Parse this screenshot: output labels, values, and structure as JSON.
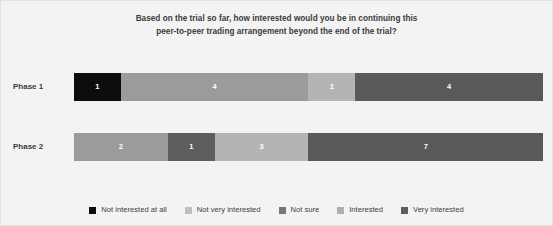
{
  "chart_data": {
    "type": "bar",
    "orientation": "horizontal",
    "stacked": true,
    "normalized": true,
    "title": "Based on the trial so far, how interested would you be in continuing this peer-to-peer trading arrangement beyond the end of the trial?",
    "title_lines": [
      "Based on the trial so far, how interested would you be in continuing this",
      "peer-to-peer trading arrangement beyond the end of the trial?"
    ],
    "xlabel": "",
    "ylabel": "",
    "grid": false,
    "legend_position": "bottom",
    "categories": [
      "Phase 1",
      "Phase 2"
    ],
    "series": [
      {
        "name": "Not interested at all",
        "color": "#0d0d0d",
        "values": [
          1,
          0
        ]
      },
      {
        "name": "Not very interested",
        "color": "#9b9b9b",
        "values": [
          4,
          2
        ]
      },
      {
        "name": "Not sure",
        "color": "#5e5e5e",
        "values": [
          0,
          1
        ]
      },
      {
        "name": "Interested",
        "color": "#b4b4b4",
        "values": [
          1,
          3
        ]
      },
      {
        "name": "Very interested",
        "color": "#595959",
        "values": [
          4,
          7
        ]
      }
    ],
    "bars": [
      {
        "category": "Phase 1",
        "total": 10,
        "segments": [
          {
            "label": "Not interested at all",
            "value": 1,
            "color": "#0d0d0d",
            "percent": 10,
            "show_value": true
          },
          {
            "label": "Not very interested",
            "value": 4,
            "color": "#9b9b9b",
            "percent": 40,
            "show_value": true
          },
          {
            "label": "Not sure",
            "value": 0,
            "color": "#5e5e5e",
            "percent": 0,
            "show_value": false
          },
          {
            "label": "Interested",
            "value": 1,
            "color": "#b4b4b4",
            "percent": 10,
            "show_value": true
          },
          {
            "label": "Very interested",
            "value": 4,
            "color": "#595959",
            "percent": 40,
            "show_value": true
          }
        ]
      },
      {
        "category": "Phase 2",
        "total": 13,
        "segments": [
          {
            "label": "Not interested at all",
            "value": 0,
            "color": "#0d0d0d",
            "percent": 0,
            "show_value": false
          },
          {
            "label": "Not very interested",
            "value": 2,
            "color": "#9b9b9b",
            "percent": 20,
            "show_value": true
          },
          {
            "label": "Not sure",
            "value": 1,
            "color": "#5e5e5e",
            "percent": 10,
            "show_value": true
          },
          {
            "label": "Interested",
            "value": 3,
            "color": "#b4b4b4",
            "percent": 20,
            "show_value": true
          },
          {
            "label": "Very interested",
            "value": 7,
            "color": "#595959",
            "percent": 50,
            "show_value": true
          }
        ]
      }
    ],
    "legend": [
      {
        "label": "Not interested at all",
        "color": "#0d0d0d"
      },
      {
        "label": "Not very interested",
        "color": "#c0c0c0"
      },
      {
        "label": "Not sure",
        "color": "#777777"
      },
      {
        "label": "Interested",
        "color": "#b0b0b0"
      },
      {
        "label": "Very interested",
        "color": "#5d5d5d"
      }
    ]
  },
  "style": {
    "background": "#f3f3f3",
    "border": "#e2e2e2",
    "text": "#3a3a3a",
    "value_text": "#ffffff"
  }
}
